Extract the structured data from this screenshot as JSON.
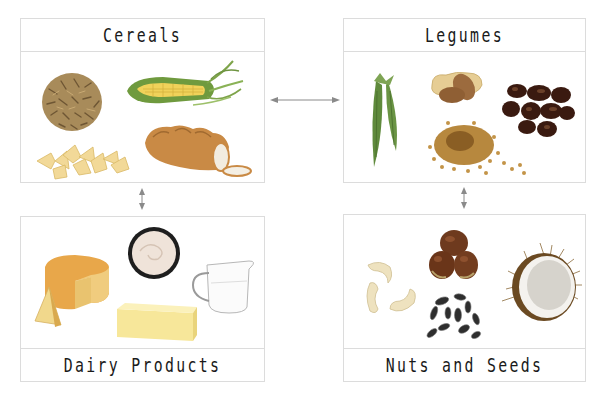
{
  "diagram": {
    "type": "food-group-network",
    "nodes": [
      {
        "id": "cereals",
        "label": "Cereals",
        "items": [
          "rice",
          "corn",
          "bowtie-pasta",
          "bread"
        ]
      },
      {
        "id": "legumes",
        "label": "Legumes",
        "items": [
          "pea-pods",
          "peanuts",
          "beans",
          "lentils"
        ]
      },
      {
        "id": "dairy",
        "label": "Dairy Products",
        "items": [
          "cheese",
          "cream",
          "milk-jug",
          "butter"
        ]
      },
      {
        "id": "nuts",
        "label": "Nuts and Seeds",
        "items": [
          "cashews",
          "chestnuts",
          "sunflower-seeds",
          "coconut"
        ]
      }
    ],
    "edges": [
      {
        "from": "cereals",
        "to": "legumes",
        "type": "bidirectional"
      },
      {
        "from": "cereals",
        "to": "dairy",
        "type": "bidirectional"
      },
      {
        "from": "legumes",
        "to": "nuts",
        "type": "bidirectional"
      }
    ]
  },
  "colors": {
    "border": "#dcdcdc",
    "arrow": "#8a8a8a",
    "text": "#1a1a1a"
  }
}
